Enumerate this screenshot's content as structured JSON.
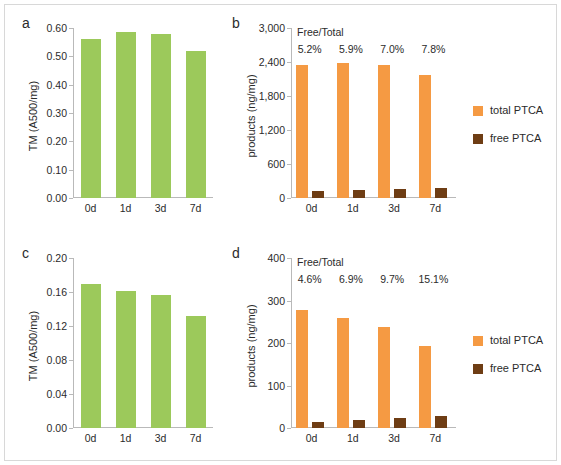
{
  "figure": {
    "background": "#ffffff",
    "border_color": "#d8d8d8",
    "colors": {
      "green": "#9cc95b",
      "orange": "#f59a43",
      "brown": "#6e3d14",
      "axis": "#b9b9b9",
      "text": "#2b2b2b"
    }
  },
  "panels": {
    "a": {
      "letter": "a"
    },
    "b": {
      "letter": "b"
    },
    "c": {
      "letter": "c"
    },
    "d": {
      "letter": "d"
    }
  },
  "legend": {
    "items": [
      {
        "label": "total PTCA",
        "color": "#f59a43",
        "icon": "orange-square-swatch"
      },
      {
        "label": "free PTCA",
        "color": "#6e3d14",
        "icon": "brown-square-swatch"
      }
    ]
  },
  "annotation": {
    "header": "Free/Total"
  },
  "chart_data": [
    {
      "id": "panel-a",
      "type": "bar",
      "title": "a",
      "xlabel": "",
      "ylabel": "TM (A500/mg)",
      "categories": [
        "0d",
        "1d",
        "3d",
        "7d"
      ],
      "series": [
        {
          "name": "TM",
          "color": "#9cc95b",
          "values": [
            0.56,
            0.585,
            0.58,
            0.518
          ]
        }
      ],
      "ylim": [
        0.0,
        0.6
      ],
      "yticks": [
        0.0,
        0.1,
        0.2,
        0.3,
        0.4,
        0.5,
        0.6
      ],
      "ytick_labels": [
        "0.00",
        "0.10",
        "0.20",
        "0.30",
        "0.40",
        "0.50",
        "0.60"
      ],
      "grid": false,
      "legend": "none"
    },
    {
      "id": "panel-b",
      "type": "bar",
      "title": "b",
      "xlabel": "",
      "ylabel": "products (ng/mg)",
      "categories": [
        "0d",
        "1d",
        "3d",
        "7d"
      ],
      "series": [
        {
          "name": "total PTCA",
          "color": "#f59a43",
          "values": [
            2350,
            2375,
            2340,
            2175
          ]
        },
        {
          "name": "free PTCA",
          "color": "#6e3d14",
          "values": [
            122,
            140,
            164,
            170
          ]
        }
      ],
      "annotations": {
        "header": "Free/Total",
        "labels": [
          "5.2%",
          "5.9%",
          "7.0%",
          "7.8%"
        ]
      },
      "ylim": [
        0,
        3000
      ],
      "yticks": [
        0,
        600,
        1200,
        1800,
        2400,
        3000
      ],
      "ytick_labels": [
        "0",
        "600",
        "1,200",
        "1,800",
        "2,400",
        "3,000"
      ],
      "grid": false,
      "legend": "right"
    },
    {
      "id": "panel-c",
      "type": "bar",
      "title": "c",
      "xlabel": "",
      "ylabel": "TM (A500/mg)",
      "categories": [
        "0d",
        "1d",
        "3d",
        "7d"
      ],
      "series": [
        {
          "name": "TM",
          "color": "#9cc95b",
          "values": [
            0.169,
            0.161,
            0.157,
            0.132
          ]
        }
      ],
      "ylim": [
        0.0,
        0.2
      ],
      "yticks": [
        0.0,
        0.04,
        0.08,
        0.12,
        0.16,
        0.2
      ],
      "ytick_labels": [
        "0.00",
        "0.04",
        "0.08",
        "0.12",
        "0.16",
        "0.20"
      ],
      "grid": false,
      "legend": "none"
    },
    {
      "id": "panel-d",
      "type": "bar",
      "title": "d",
      "xlabel": "",
      "ylabel": "products (ng/mg)",
      "categories": [
        "0d",
        "1d",
        "3d",
        "7d"
      ],
      "series": [
        {
          "name": "total PTCA",
          "color": "#f59a43",
          "values": [
            277,
            260,
            237,
            193
          ]
        },
        {
          "name": "free PTCA",
          "color": "#6e3d14",
          "values": [
            13,
            18,
            23,
            29
          ]
        }
      ],
      "annotations": {
        "header": "Free/Total",
        "labels": [
          "4.6%",
          "6.9%",
          "9.7%",
          "15.1%"
        ]
      },
      "ylim": [
        0,
        400
      ],
      "yticks": [
        0,
        100,
        200,
        300,
        400
      ],
      "ytick_labels": [
        "0",
        "100",
        "200",
        "300",
        "400"
      ],
      "grid": false,
      "legend": "right"
    }
  ]
}
